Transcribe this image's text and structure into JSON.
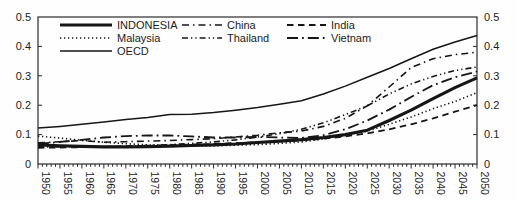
{
  "figure": {
    "background": "#fefefe",
    "line_color": "#161616",
    "axis_color": "#2b2b2b",
    "text_color": "#1c1c1c"
  },
  "chart_data": {
    "type": "line",
    "title": "",
    "xlabel": "",
    "ylabel": "",
    "xlim": [
      1950,
      2050
    ],
    "ylim": [
      0,
      0.5
    ],
    "grid": false,
    "legend_position": "top-left-inside",
    "x": [
      1950,
      1955,
      1960,
      1965,
      1970,
      1975,
      1980,
      1985,
      1990,
      1995,
      2000,
      2005,
      2010,
      2015,
      2020,
      2025,
      2030,
      2035,
      2040,
      2045,
      2050
    ],
    "x_tick_labels": [
      "1950",
      "1955",
      "1960",
      "1965",
      "1970",
      "1975",
      "1980",
      "1985",
      "1990",
      "1995",
      "2000",
      "2005",
      "2010",
      "2015",
      "2020",
      "2025",
      "2030",
      "2035",
      "2040",
      "2045",
      "2050"
    ],
    "x_minor_tick_step": 1,
    "yticks": [
      0,
      0.1,
      0.2,
      0.3,
      0.4,
      0.5
    ],
    "ytick_labels": [
      "0",
      "0.1",
      "0.2",
      "0.3",
      "0.4",
      "0.5"
    ],
    "y_axis_sides": [
      "left",
      "right"
    ],
    "series": [
      {
        "name": "INDONESIA",
        "style": "solid-thick",
        "values": [
          0.065,
          0.062,
          0.06,
          0.058,
          0.058,
          0.059,
          0.061,
          0.063,
          0.065,
          0.068,
          0.073,
          0.078,
          0.083,
          0.09,
          0.1,
          0.115,
          0.148,
          0.183,
          0.222,
          0.26,
          0.293
        ]
      },
      {
        "name": "Malaysia",
        "style": "dotted",
        "values": [
          0.095,
          0.088,
          0.081,
          0.074,
          0.069,
          0.065,
          0.063,
          0.061,
          0.062,
          0.064,
          0.066,
          0.07,
          0.075,
          0.085,
          0.098,
          0.112,
          0.135,
          0.16,
          0.188,
          0.213,
          0.243
        ]
      },
      {
        "name": "OECD",
        "style": "solid",
        "values": [
          0.122,
          0.128,
          0.135,
          0.143,
          0.151,
          0.158,
          0.168,
          0.169,
          0.175,
          0.183,
          0.192,
          0.203,
          0.215,
          0.238,
          0.265,
          0.295,
          0.325,
          0.358,
          0.39,
          0.415,
          0.437
        ]
      },
      {
        "name": "China",
        "style": "dash-dot",
        "values": [
          0.072,
          0.076,
          0.08,
          0.074,
          0.076,
          0.078,
          0.08,
          0.083,
          0.086,
          0.092,
          0.098,
          0.106,
          0.112,
          0.128,
          0.155,
          0.198,
          0.262,
          0.328,
          0.358,
          0.372,
          0.38
        ]
      },
      {
        "name": "Thailand",
        "style": "dash-dot-dot",
        "values": [
          0.058,
          0.058,
          0.058,
          0.059,
          0.06,
          0.063,
          0.066,
          0.07,
          0.075,
          0.082,
          0.092,
          0.103,
          0.118,
          0.14,
          0.168,
          0.198,
          0.238,
          0.272,
          0.298,
          0.318,
          0.33
        ]
      },
      {
        "name": "India",
        "style": "dashed",
        "values": [
          0.055,
          0.056,
          0.057,
          0.058,
          0.06,
          0.062,
          0.064,
          0.066,
          0.068,
          0.071,
          0.074,
          0.077,
          0.08,
          0.086,
          0.094,
          0.104,
          0.118,
          0.135,
          0.155,
          0.178,
          0.2
        ]
      },
      {
        "name": "Vietnam",
        "style": "long-dash-dot",
        "values": [
          0.068,
          0.075,
          0.082,
          0.09,
          0.095,
          0.097,
          0.097,
          0.094,
          0.09,
          0.09,
          0.092,
          0.09,
          0.088,
          0.098,
          0.118,
          0.148,
          0.185,
          0.228,
          0.268,
          0.295,
          0.315
        ]
      }
    ],
    "legend_columns": [
      [
        "INDONESIA",
        "Malaysia",
        "OECD"
      ],
      [
        "China",
        "Thailand"
      ],
      [
        "India",
        "Vietnam"
      ]
    ]
  }
}
